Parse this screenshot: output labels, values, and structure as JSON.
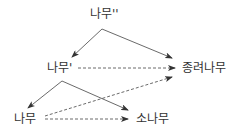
{
  "diagram": {
    "nodes": [
      {
        "id": "namu2",
        "label": "나무''"
      },
      {
        "id": "namu1",
        "label": "나무'"
      },
      {
        "id": "jongryeo",
        "label": "종려나무"
      },
      {
        "id": "namu",
        "label": "나무"
      },
      {
        "id": "sonamu",
        "label": "소나무"
      }
    ],
    "edges": [
      {
        "from": "namu2",
        "to": "namu1",
        "style": "solid"
      },
      {
        "from": "namu2",
        "to": "jongryeo",
        "style": "solid"
      },
      {
        "from": "namu1",
        "to": "jongryeo",
        "style": "dashed"
      },
      {
        "from": "namu1",
        "to": "namu",
        "style": "solid"
      },
      {
        "from": "namu1",
        "to": "sonamu",
        "style": "solid"
      },
      {
        "from": "namu",
        "to": "sonamu",
        "style": "dashed"
      },
      {
        "from": "namu",
        "to": "jongryeo",
        "style": "dashed"
      }
    ],
    "colors": {
      "line": "#333333",
      "text": "#333333"
    }
  }
}
